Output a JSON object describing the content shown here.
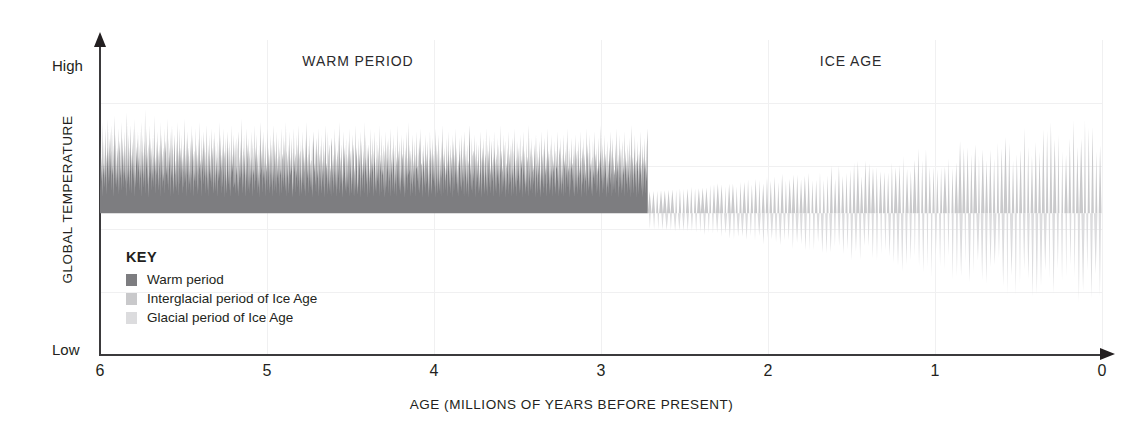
{
  "chart_data": {
    "type": "area",
    "title": "",
    "xlabel": "AGE (MILLIONS OF YEARS BEFORE PRESENT)",
    "ylabel": "GLOBAL TEMPERATURE",
    "xlim": [
      6,
      0
    ],
    "ylim": [
      0,
      100
    ],
    "x_tick_labels": [
      "6",
      "5",
      "4",
      "3",
      "2",
      "1",
      "0"
    ],
    "x_tick_values": [
      6,
      5,
      4,
      3,
      2,
      1,
      0
    ],
    "y_axis_end_labels": {
      "high": "High",
      "low": "Low"
    },
    "grid": "faint",
    "legend_position": "inside-lower-left",
    "baseline_value": 45,
    "annotations": [
      {
        "text": "WARM PERIOD",
        "x": 4.45,
        "y": 96
      },
      {
        "text": "ICE AGE",
        "x": 1.5,
        "y": 96
      }
    ],
    "transition_x": 2.72,
    "series": [
      {
        "name": "Warm period",
        "color": "#7d7d80",
        "x_range": [
          6.0,
          2.72
        ],
        "description": "Dense high-frequency oscillations entirely above baseline; amplitude 45 to 82 with peaks to 88",
        "values": [
          58,
          70,
          52,
          63,
          55,
          74,
          50,
          61,
          57,
          68,
          53,
          60,
          72,
          56,
          64,
          51,
          66,
          59,
          75,
          54,
          62,
          69,
          55,
          71,
          58,
          65,
          52,
          73,
          60,
          57,
          67,
          50,
          63,
          76,
          54,
          61,
          70,
          53,
          59,
          66,
          55,
          72,
          58,
          51,
          64,
          68,
          56,
          60,
          74,
          52,
          62,
          69,
          57,
          65,
          53,
          71,
          59,
          55,
          67,
          50,
          63,
          77,
          54,
          60,
          70,
          56,
          66,
          52,
          61,
          73,
          58,
          64,
          51,
          68,
          57,
          72,
          55,
          62,
          50,
          75,
          59,
          53,
          66,
          60,
          69,
          54,
          71,
          58,
          63,
          52,
          67,
          56,
          61,
          74,
          50,
          65,
          57,
          70,
          53,
          60,
          68,
          55,
          78,
          51,
          64,
          59,
          72,
          54,
          62,
          67,
          50,
          58,
          73,
          56,
          61,
          69,
          52,
          66,
          60,
          55,
          70,
          53,
          64,
          58,
          76,
          51,
          63,
          57,
          68,
          54,
          71,
          60,
          52,
          65,
          59,
          67,
          50,
          74,
          56,
          62,
          70,
          53,
          61,
          66,
          55,
          58,
          72,
          51,
          64,
          68,
          57,
          60,
          75,
          54,
          63,
          52,
          69,
          59,
          66,
          50,
          71,
          56,
          61,
          73,
          55,
          67,
          58,
          51,
          64,
          70,
          53,
          62,
          57,
          68,
          52,
          60,
          74,
          50,
          65,
          59,
          72,
          54,
          61,
          66,
          56,
          70,
          51,
          63,
          58,
          67,
          53,
          60,
          75,
          55,
          64,
          50,
          69,
          57,
          62,
          71,
          52,
          66,
          59,
          54,
          68,
          60,
          51,
          73,
          56,
          63,
          70,
          50,
          61,
          65,
          58,
          55,
          72,
          53,
          67,
          60,
          51,
          64,
          57,
          69,
          52,
          74,
          59,
          62,
          55,
          70,
          50,
          66,
          58,
          63,
          71,
          54,
          60,
          68,
          51,
          65,
          56,
          61,
          73,
          52,
          59,
          67,
          50,
          70,
          57,
          64,
          55,
          60,
          72,
          53,
          62,
          66,
          51,
          58,
          69,
          54,
          71,
          60,
          52,
          65,
          57,
          63,
          50,
          68,
          59,
          55,
          74,
          56,
          61,
          70,
          51,
          64,
          58,
          67,
          53,
          60,
          72,
          50,
          62,
          65,
          55,
          69,
          57,
          51,
          63,
          71,
          54,
          59,
          66,
          52,
          68,
          60,
          50,
          73,
          56,
          64,
          58,
          61,
          70,
          53,
          55,
          67,
          51,
          62,
          69,
          57,
          60,
          52,
          65,
          71,
          50,
          58,
          63,
          54,
          68,
          56,
          61,
          75,
          51,
          59,
          66,
          53,
          70,
          57,
          64,
          50,
          60,
          72,
          55,
          62,
          67,
          52,
          58,
          69,
          51,
          65,
          60,
          54,
          71,
          56,
          63,
          50,
          68,
          59,
          57,
          73,
          52,
          61,
          66,
          55,
          60,
          70,
          51,
          64,
          58,
          53,
          67,
          50,
          62,
          74,
          57,
          60,
          65,
          51,
          69,
          56,
          59,
          71,
          54,
          63,
          50,
          68,
          58,
          61,
          55,
          72,
          52,
          66,
          60,
          51,
          64,
          57,
          70,
          53,
          59,
          67,
          50,
          62,
          73,
          55,
          61,
          68,
          52,
          58,
          65,
          51,
          71,
          60,
          56,
          63,
          54,
          69,
          50,
          66,
          59,
          57,
          72,
          51,
          62,
          64,
          55,
          70,
          53,
          60,
          68,
          52,
          58,
          74,
          50,
          65,
          61,
          56,
          67,
          51,
          59,
          71,
          54,
          63,
          57,
          60,
          69,
          50,
          55,
          66,
          52,
          72,
          58,
          61,
          64,
          51,
          70,
          56,
          59,
          67,
          53,
          60,
          73,
          50,
          62,
          65,
          55,
          68,
          51,
          57,
          71,
          54,
          66,
          60,
          52,
          63,
          58,
          69,
          50,
          61,
          74,
          56,
          59,
          64,
          51,
          67,
          55,
          70,
          53,
          60,
          62,
          52,
          68,
          57,
          50,
          65,
          71,
          58,
          61,
          54,
          66,
          51,
          63,
          69,
          56,
          59,
          72,
          50,
          60,
          64,
          52,
          67,
          55,
          70,
          51,
          58,
          62,
          53,
          68,
          57,
          65,
          50,
          60,
          73,
          56,
          61,
          59,
          51,
          71,
          54,
          63,
          67,
          52,
          58,
          60,
          50,
          66,
          69,
          55,
          62,
          51,
          64,
          57,
          72,
          53,
          59,
          68,
          50,
          60,
          65,
          52,
          70,
          56,
          61,
          74,
          51,
          58,
          63,
          54,
          67,
          60,
          50,
          59,
          71,
          55,
          62,
          66,
          52,
          57,
          69,
          51,
          64,
          60,
          53,
          68,
          58,
          50,
          72,
          56,
          65,
          59,
          51,
          61,
          70,
          54,
          63,
          67,
          50,
          57,
          60,
          52,
          73,
          58,
          66,
          62,
          51,
          55,
          69,
          53,
          64,
          59,
          71,
          50,
          60,
          68,
          56,
          61,
          52,
          65,
          57,
          74,
          51,
          63,
          58,
          70,
          54,
          59,
          66,
          50,
          62,
          67,
          55,
          60,
          51,
          72,
          56,
          64,
          53,
          69,
          58,
          61,
          50,
          65,
          59,
          71,
          52,
          57,
          63,
          51,
          68,
          60,
          55,
          66,
          54,
          73,
          50,
          62,
          58,
          64,
          51,
          70,
          57,
          59,
          67,
          52,
          60,
          65,
          50,
          56,
          71,
          53,
          61,
          68,
          58,
          63,
          51,
          69,
          55,
          60,
          72,
          50,
          64,
          57,
          62,
          52,
          66,
          59,
          70,
          51,
          58,
          67,
          54,
          60,
          63,
          50,
          73,
          56,
          65,
          61,
          52,
          59,
          68,
          51,
          57,
          70,
          55,
          62,
          64,
          53,
          60,
          69,
          50,
          58,
          66,
          51,
          71,
          60,
          56,
          63,
          52,
          74,
          57,
          59,
          67,
          50,
          61,
          65,
          54,
          60,
          70,
          51,
          58,
          62,
          53,
          68,
          57,
          64,
          50,
          71,
          59,
          60,
          55,
          66,
          52,
          63,
          69,
          51,
          57,
          72,
          56,
          61,
          60,
          50,
          65,
          58,
          67,
          53,
          62,
          51,
          70,
          59,
          64,
          54,
          60,
          68,
          50,
          56,
          63,
          52,
          71,
          57,
          66,
          61,
          51,
          58,
          69,
          55,
          60,
          64,
          53,
          62,
          72,
          50,
          59,
          67,
          51,
          57,
          65,
          54,
          70,
          60,
          52,
          58,
          63,
          50,
          68,
          56,
          61,
          73,
          51,
          64,
          59,
          66,
          55,
          60,
          52,
          69,
          57,
          62,
          50,
          71,
          58,
          65,
          53,
          60,
          67,
          51,
          59,
          63,
          56,
          70,
          50,
          61,
          68,
          52,
          64,
          57,
          72,
          54,
          60,
          66,
          51,
          58,
          62,
          50,
          69,
          59,
          65,
          53,
          61,
          70,
          52,
          57,
          63,
          55,
          68,
          50,
          60,
          71,
          56,
          64,
          51,
          59,
          67,
          54,
          62,
          60,
          50,
          66,
          73,
          57,
          61,
          52,
          58,
          69,
          51,
          63,
          65,
          55,
          60,
          70,
          50,
          59,
          64,
          53,
          68,
          56,
          62,
          51,
          67,
          60,
          52,
          58,
          71,
          57,
          63,
          50,
          61,
          66,
          54,
          69,
          59,
          51,
          60,
          64,
          56,
          72,
          52,
          58,
          67,
          50,
          65,
          61,
          53,
          70,
          57,
          60,
          51,
          62,
          68,
          55,
          59,
          63,
          50,
          71,
          58,
          66,
          52,
          60,
          64,
          51,
          69,
          56,
          61,
          54,
          67,
          59,
          50,
          73,
          57,
          62,
          65,
          51,
          58,
          60,
          53,
          70,
          55,
          63,
          68,
          50,
          59,
          61,
          52,
          66,
          57,
          71,
          51,
          60,
          64,
          54,
          58,
          67,
          50,
          62,
          69,
          56,
          60,
          51,
          65,
          59,
          72,
          53,
          57,
          63,
          50,
          68,
          61,
          55,
          60,
          66,
          51,
          58,
          70,
          52,
          64,
          59,
          62,
          50,
          67,
          57,
          71,
          54,
          60,
          65,
          51,
          56,
          68,
          53,
          61,
          63,
          50,
          59,
          73,
          55,
          60,
          66,
          52,
          57,
          69,
          51,
          64,
          58,
          60,
          54,
          62,
          67,
          50,
          59,
          70,
          56,
          61,
          51,
          65,
          57,
          63,
          52,
          68,
          60,
          50,
          58,
          71,
          55,
          64,
          59,
          53,
          66,
          51,
          62,
          69,
          57,
          60,
          50,
          63,
          58,
          72,
          54,
          61,
          65,
          51,
          59,
          67,
          52,
          60,
          56,
          70,
          50,
          64,
          58,
          62,
          53,
          68,
          57,
          51,
          65,
          60,
          59,
          71,
          55,
          61,
          50,
          63,
          66,
          52,
          58,
          69,
          51,
          57,
          64,
          54,
          60,
          70,
          50,
          62,
          59,
          65,
          51,
          68,
          56,
          61,
          53,
          72,
          58,
          60,
          50,
          66,
          57,
          63,
          52,
          69,
          59,
          61,
          55,
          64,
          51,
          67,
          60,
          50,
          58,
          70,
          53,
          62,
          65,
          51,
          59,
          68,
          56,
          60,
          52,
          71,
          57,
          63,
          50,
          61,
          66,
          54,
          58,
          69,
          51,
          64,
          60,
          55,
          59,
          72,
          50,
          62,
          67,
          52,
          57,
          65,
          53,
          70,
          58,
          61,
          51,
          60,
          63,
          50,
          68,
          56,
          59,
          71,
          54,
          61,
          64,
          51,
          66,
          57,
          60,
          52,
          69,
          58,
          62,
          50,
          65,
          59,
          73,
          55,
          60,
          67,
          51,
          63,
          58,
          52,
          70,
          56,
          61,
          64,
          50,
          59,
          68,
          53,
          57,
          62,
          51,
          66,
          60,
          71,
          54,
          58,
          65,
          50,
          61,
          69,
          52,
          63,
          57,
          59,
          51,
          67,
          60,
          55,
          72,
          58,
          62,
          50,
          64,
          56,
          70,
          53,
          59,
          66,
          51,
          61,
          68,
          52,
          60,
          57,
          63,
          50,
          71,
          58,
          65,
          54,
          59,
          62,
          51,
          67,
          60,
          56,
          69,
          52,
          58,
          64,
          50,
          61,
          73,
          55,
          63,
          59,
          51,
          66,
          57,
          70,
          53,
          60,
          62,
          50,
          68,
          58,
          64,
          51,
          59,
          65,
          54,
          71,
          57,
          61,
          52,
          60,
          67,
          50,
          56,
          63,
          58,
          69,
          51,
          62,
          59,
          55,
          66,
          72,
          50
        ]
      },
      {
        "name": "Interglacial period of Ice Age",
        "color": "#c9c9cb",
        "x_range": [
          2.72,
          0.0
        ],
        "description": "Light gray upward spikes above baseline; amplitude grows toward present, peaks 52 to 78"
      },
      {
        "name": "Glacial period of Ice Age",
        "color": "#dcdcde",
        "x_range": [
          2.72,
          0.0
        ],
        "description": "Very light gray downward spikes below baseline; depth grows toward present, minima 40 down to 12"
      }
    ]
  },
  "legend": {
    "title": "KEY",
    "items": [
      {
        "label": "Warm period",
        "color": "#7d7d80"
      },
      {
        "label": "Interglacial period of Ice Age",
        "color": "#c9c9cb"
      },
      {
        "label": "Glacial period of Ice Age",
        "color": "#dcdcde"
      }
    ]
  },
  "colors": {
    "warm": "#7d7d80",
    "interglacial": "#c9c9cb",
    "glacial": "#dcdcde",
    "axis": "#3b3a3c",
    "text": "#231f20",
    "grid": "#f0f0f1",
    "background": "#ffffff"
  }
}
